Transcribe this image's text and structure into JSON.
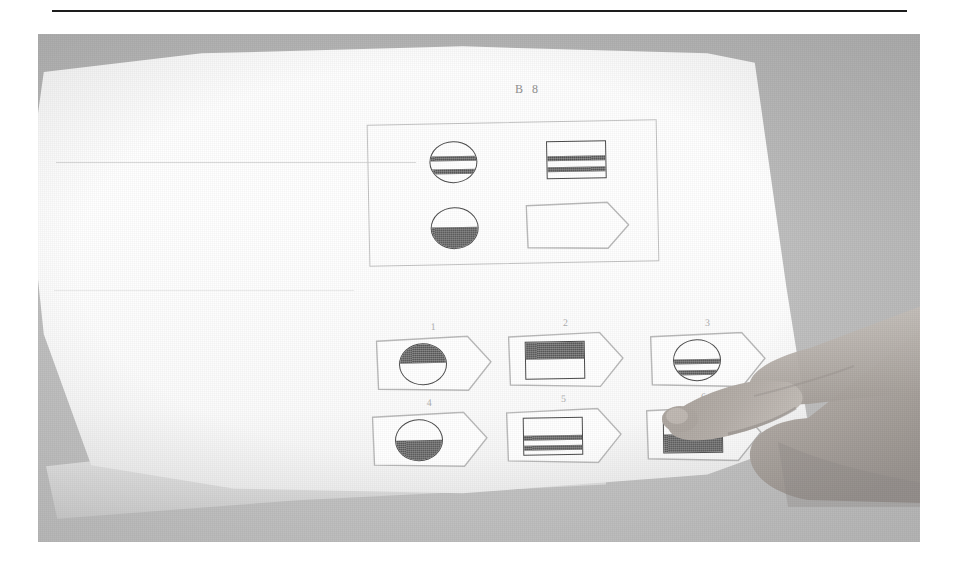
{
  "figure": {
    "medium": "black-and-white photograph",
    "top_rule": true
  },
  "booklet": {
    "item_heading": "B 8",
    "matrix": {
      "label": "problem matrix",
      "cells": [
        {
          "position": "top-left",
          "shape": "circle",
          "fill": "two-stripes",
          "empty": false
        },
        {
          "position": "top-right",
          "shape": "rectangle",
          "fill": "two-stripes",
          "empty": false
        },
        {
          "position": "bottom-left",
          "shape": "circle",
          "fill": "bottom-half",
          "empty": false
        },
        {
          "position": "bottom-right",
          "shape": "pentagon",
          "fill": "none",
          "empty": true
        }
      ]
    },
    "options": [
      {
        "number": "1",
        "shape": "circle",
        "fill": "top-half"
      },
      {
        "number": "2",
        "shape": "rectangle",
        "fill": "top-half"
      },
      {
        "number": "3",
        "shape": "circle",
        "fill": "two-stripes"
      },
      {
        "number": "4",
        "shape": "circle",
        "fill": "bottom-half"
      },
      {
        "number": "5",
        "shape": "rectangle",
        "fill": "two-stripes"
      },
      {
        "number": "6",
        "shape": "rectangle",
        "fill": "bottom-half"
      }
    ],
    "pointed_option": "6"
  },
  "colors": {
    "page": "#fdfdfd",
    "desk": "#bdbdbd",
    "ink": "#4a4a4a",
    "outline": "#b9b9b9",
    "rule": "#1d1d1d",
    "skin": "#b9b2ac"
  }
}
